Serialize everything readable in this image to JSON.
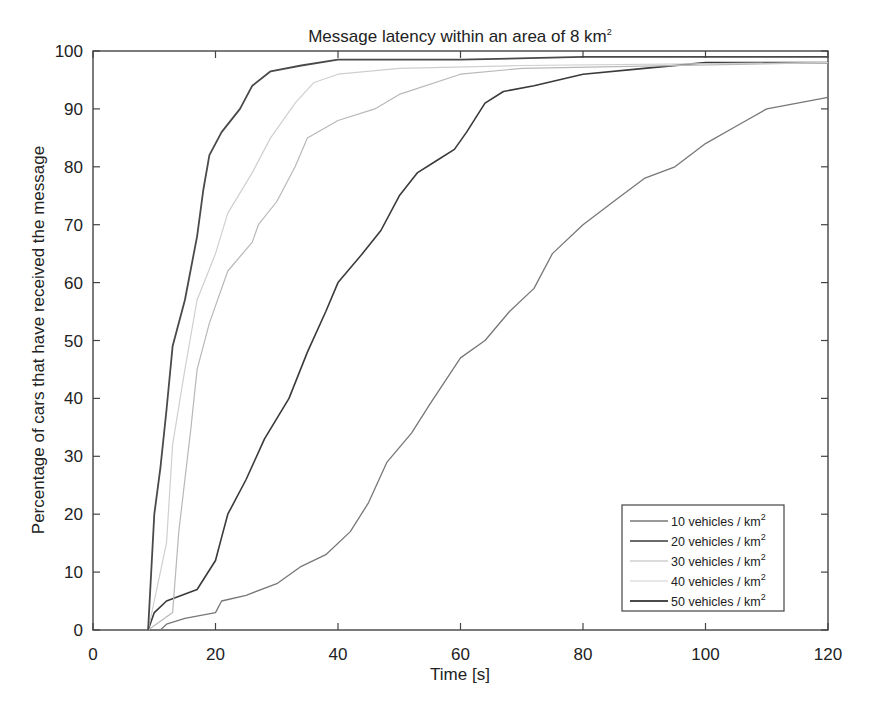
{
  "chart_data": {
    "type": "line",
    "title": "Message latency within an area of 8 km",
    "title_superscript": "2",
    "xlabel": "Time [s]",
    "ylabel": "Percentage of cars that have received the message",
    "xlim": [
      0,
      120
    ],
    "ylim": [
      0,
      100
    ],
    "xticks": [
      0,
      20,
      40,
      60,
      80,
      100,
      120
    ],
    "yticks": [
      0,
      10,
      20,
      30,
      40,
      50,
      60,
      70,
      80,
      90,
      100
    ],
    "grid": false,
    "legend_position": "lower right",
    "series": [
      {
        "name": "10 vehicles / km",
        "superscript": "2",
        "color": "#777777",
        "width": 1.3,
        "points": [
          [
            9,
            0
          ],
          [
            11,
            0
          ],
          [
            12,
            1
          ],
          [
            15,
            2
          ],
          [
            20,
            3
          ],
          [
            21,
            5
          ],
          [
            25,
            6
          ],
          [
            30,
            8
          ],
          [
            34,
            11
          ],
          [
            38,
            13
          ],
          [
            42,
            17
          ],
          [
            45,
            22
          ],
          [
            48,
            29
          ],
          [
            52,
            34
          ],
          [
            55,
            39
          ],
          [
            60,
            47
          ],
          [
            64,
            50
          ],
          [
            68,
            55
          ],
          [
            72,
            59
          ],
          [
            75,
            65
          ],
          [
            80,
            70
          ],
          [
            85,
            74
          ],
          [
            90,
            78
          ],
          [
            95,
            80
          ],
          [
            100,
            84
          ],
          [
            105,
            87
          ],
          [
            110,
            90
          ],
          [
            120,
            92
          ]
        ]
      },
      {
        "name": "20 vehicles / km",
        "superscript": "2",
        "color": "#3a3a3a",
        "width": 1.6,
        "points": [
          [
            9,
            0
          ],
          [
            10,
            3
          ],
          [
            12,
            5
          ],
          [
            17,
            7
          ],
          [
            20,
            12
          ],
          [
            21,
            16
          ],
          [
            22,
            20
          ],
          [
            25,
            26
          ],
          [
            28,
            33
          ],
          [
            32,
            40
          ],
          [
            35,
            48
          ],
          [
            38,
            55
          ],
          [
            40,
            60
          ],
          [
            44,
            65
          ],
          [
            47,
            69
          ],
          [
            50,
            75
          ],
          [
            53,
            79
          ],
          [
            56,
            81
          ],
          [
            59,
            83
          ],
          [
            61,
            86
          ],
          [
            64,
            91
          ],
          [
            67,
            93
          ],
          [
            72,
            94
          ],
          [
            80,
            96
          ],
          [
            90,
            97
          ],
          [
            100,
            98
          ],
          [
            120,
            98
          ]
        ]
      },
      {
        "name": "30 vehicles / km",
        "superscript": "2",
        "color": "#b8b8b8",
        "width": 1.2,
        "points": [
          [
            9,
            0
          ],
          [
            13,
            3
          ],
          [
            14,
            17
          ],
          [
            16,
            35
          ],
          [
            17,
            45
          ],
          [
            19,
            53
          ],
          [
            22,
            62
          ],
          [
            26,
            67
          ],
          [
            27,
            70
          ],
          [
            30,
            74
          ],
          [
            33,
            80
          ],
          [
            35,
            85
          ],
          [
            40,
            88
          ],
          [
            46,
            90
          ],
          [
            50,
            92.5
          ],
          [
            60,
            96
          ],
          [
            70,
            97
          ],
          [
            120,
            98
          ]
        ]
      },
      {
        "name": "40 vehicles / km",
        "superscript": "2",
        "color": "#cfcfcf",
        "width": 1.2,
        "points": [
          [
            9,
            0
          ],
          [
            12,
            15
          ],
          [
            13,
            32
          ],
          [
            15,
            45
          ],
          [
            17,
            57
          ],
          [
            20,
            65
          ],
          [
            22,
            72
          ],
          [
            26,
            79
          ],
          [
            29,
            85
          ],
          [
            33,
            91
          ],
          [
            36,
            94.5
          ],
          [
            40,
            96
          ],
          [
            50,
            97
          ],
          [
            70,
            97.5
          ],
          [
            120,
            98
          ]
        ]
      },
      {
        "name": "50 vehicles / km",
        "superscript": "2",
        "color": "#4a4a4a",
        "width": 1.8,
        "points": [
          [
            9,
            0
          ],
          [
            10,
            20
          ],
          [
            11,
            28
          ],
          [
            12,
            38
          ],
          [
            13,
            49
          ],
          [
            15,
            57
          ],
          [
            17,
            68
          ],
          [
            18,
            76
          ],
          [
            19,
            82
          ],
          [
            21,
            86
          ],
          [
            24,
            90
          ],
          [
            26,
            94
          ],
          [
            29,
            96.5
          ],
          [
            34,
            97.5
          ],
          [
            40,
            98.5
          ],
          [
            60,
            98.5
          ],
          [
            80,
            99
          ],
          [
            120,
            99
          ]
        ]
      }
    ]
  },
  "legend": {
    "items": [
      {
        "label": "10 vehicles / km",
        "sup": "2"
      },
      {
        "label": "20 vehicles / km",
        "sup": "2"
      },
      {
        "label": "30 vehicles / km",
        "sup": "2"
      },
      {
        "label": "40 vehicles / km",
        "sup": "2"
      },
      {
        "label": "50 vehicles / km",
        "sup": "2"
      }
    ]
  }
}
